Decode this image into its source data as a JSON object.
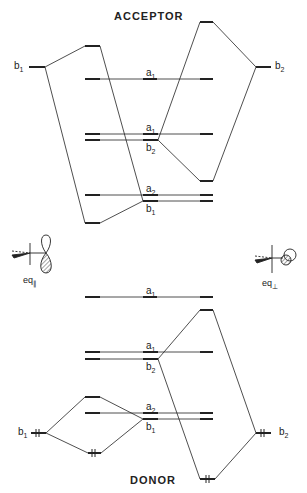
{
  "diagram": {
    "title_top": "ACCEPTOR",
    "title_bottom": "DONOR",
    "acceptor": {
      "left_fragment": {
        "label": "b",
        "sub": "1"
      },
      "right_fragment": {
        "label": "b",
        "sub": "2"
      },
      "levels": [
        {
          "label": "a",
          "sub": "1"
        },
        {
          "label": "a",
          "sub": "1"
        },
        {
          "label": "b",
          "sub": "2"
        },
        {
          "label": "a",
          "sub": "2"
        },
        {
          "label": "b",
          "sub": "1"
        }
      ]
    },
    "geometries": {
      "left": {
        "label": "eq",
        "sub": "∥"
      },
      "right": {
        "label": "eq",
        "sub": "⊥"
      }
    },
    "donor": {
      "left_fragment": {
        "label": "b",
        "sub": "1"
      },
      "right_fragment": {
        "label": "b",
        "sub": "2"
      },
      "levels": [
        {
          "label": "a",
          "sub": "1"
        },
        {
          "label": "a",
          "sub": "1"
        },
        {
          "label": "b",
          "sub": "2"
        },
        {
          "label": "a",
          "sub": "2"
        },
        {
          "label": "b",
          "sub": "1"
        }
      ],
      "electron_pair_marker": "⥮"
    }
  }
}
